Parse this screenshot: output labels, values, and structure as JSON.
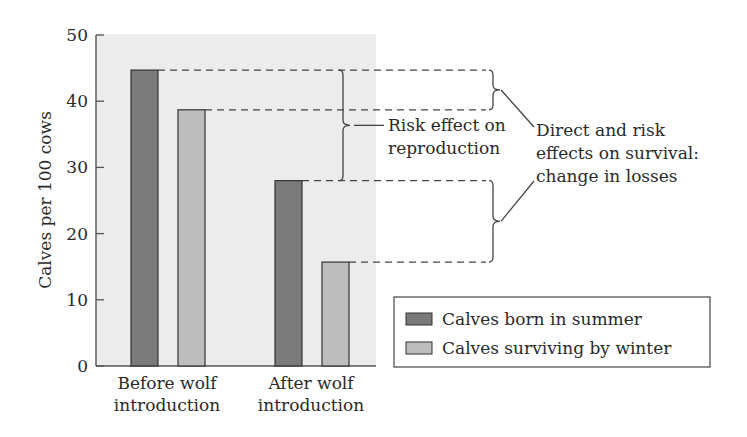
{
  "chart_data": {
    "type": "bar",
    "title": "",
    "xlabel": "",
    "ylabel": "Calves per 100 cows",
    "ylim": [
      0,
      50
    ],
    "yticks": [
      0,
      10,
      20,
      30,
      40,
      50
    ],
    "grid": false,
    "categories": [
      "Before wolf introduction",
      "After wolf introduction"
    ],
    "category_lines": [
      [
        "Before wolf",
        "introduction"
      ],
      [
        "After wolf",
        "introduction"
      ]
    ],
    "series": [
      {
        "name": "Calves born in summer",
        "color": "#7a7a7a",
        "values": [
          44.7,
          28.0
        ]
      },
      {
        "name": "Calves surviving by winter",
        "color": "#bdbdbd",
        "values": [
          38.7,
          15.7
        ]
      }
    ],
    "legend": {
      "position": "lower right",
      "entries": [
        "Calves born in summer",
        "Calves surviving by winter"
      ]
    },
    "annotations": [
      {
        "id": "risk-reproduction",
        "lines": [
          "Risk effect on",
          "reproduction"
        ],
        "spans": "summer births before (44.7) to summer births after (28.0)"
      },
      {
        "id": "survival",
        "lines": [
          "Direct and risk",
          "effects on survival:",
          "change in losses"
        ],
        "spans": [
          "before: 44.7 to 38.7",
          "after: 28.0 to 15.7"
        ]
      }
    ]
  },
  "colors": {
    "plot_background": "#ececec",
    "axis": "#555555",
    "dark_bar": "#7a7a7a",
    "light_bar": "#bdbdbd"
  }
}
